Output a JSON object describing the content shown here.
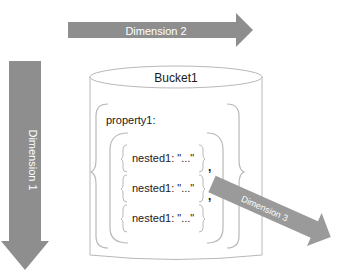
{
  "diagram": {
    "bucket": {
      "label": "Bucket1"
    },
    "property": {
      "label": "property1:"
    },
    "nested_items": [
      {
        "label": "nested1: \"...\""
      },
      {
        "label": "nested1: \"...\""
      },
      {
        "label": "nested1: \"...\""
      }
    ],
    "separators": [
      ",",
      ","
    ],
    "arrows": {
      "dimension1": {
        "label": "Dimension 1",
        "direction": "down"
      },
      "dimension2": {
        "label": "Dimension 2",
        "direction": "right"
      },
      "dimension3": {
        "label": "Dimension 3",
        "direction": "down-right"
      }
    },
    "colors": {
      "arrow_fill": "#8c8c8c",
      "arrow_text": "#ffffff",
      "line": "#b5b5b5",
      "text": "#1a1a1a"
    }
  }
}
